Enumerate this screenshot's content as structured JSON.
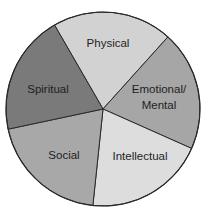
{
  "chart_data": {
    "type": "pie",
    "title": "",
    "categories": [
      "Physical",
      "Emotional/Mental",
      "Intellectual",
      "Social",
      "Spiritual"
    ],
    "values": [
      20,
      20,
      20,
      20,
      20
    ],
    "colors": [
      "#d2d2d2",
      "#a6a6a6",
      "#dddddd",
      "#a8a8a8",
      "#7a7a7a"
    ],
    "start_angle_deg": 240,
    "direction": "clockwise",
    "legend": "none",
    "labels_inside": true
  },
  "labels": {
    "physical": "Physical",
    "emotional_line1": "Emotional/",
    "emotional_line2": "Mental",
    "intellectual": "Intellectual",
    "social": "Social",
    "spiritual": "Spiritual"
  }
}
